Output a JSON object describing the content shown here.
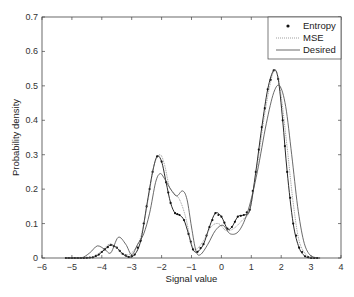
{
  "chart_data": {
    "type": "line",
    "title": "",
    "xlabel": "Signal value",
    "ylabel": "Probability density",
    "xlim": [
      -6,
      4
    ],
    "ylim": [
      0,
      0.7
    ],
    "xticks": [
      -6,
      -5,
      -4,
      -3,
      -2,
      -1,
      0,
      1,
      2,
      3,
      4
    ],
    "yticks": [
      0,
      0.1,
      0.2,
      0.3,
      0.4,
      0.5,
      0.6,
      0.7
    ],
    "grid": false,
    "legend_position": "upper right",
    "series": [
      {
        "name": "Entropy",
        "style": "dotted line with markers",
        "points": [
          [
            -5.2,
            0
          ],
          [
            -4.6,
            0
          ],
          [
            -4.3,
            0.002
          ],
          [
            -4.1,
            0.01
          ],
          [
            -3.9,
            0.025
          ],
          [
            -3.7,
            0.038
          ],
          [
            -3.5,
            0.03
          ],
          [
            -3.3,
            0.012
          ],
          [
            -3.1,
            0.003
          ],
          [
            -2.9,
            0.01
          ],
          [
            -2.7,
            0.05
          ],
          [
            -2.5,
            0.15
          ],
          [
            -2.3,
            0.25
          ],
          [
            -2.15,
            0.295
          ],
          [
            -2.0,
            0.28
          ],
          [
            -1.85,
            0.22
          ],
          [
            -1.7,
            0.16
          ],
          [
            -1.55,
            0.13
          ],
          [
            -1.4,
            0.125
          ],
          [
            -1.25,
            0.11
          ],
          [
            -1.1,
            0.07
          ],
          [
            -0.95,
            0.025
          ],
          [
            -0.8,
            0.018
          ],
          [
            -0.6,
            0.04
          ],
          [
            -0.4,
            0.09
          ],
          [
            -0.2,
            0.13
          ],
          [
            0.0,
            0.12
          ],
          [
            0.2,
            0.085
          ],
          [
            0.35,
            0.09
          ],
          [
            0.55,
            0.12
          ],
          [
            0.75,
            0.125
          ],
          [
            0.95,
            0.14
          ],
          [
            1.15,
            0.25
          ],
          [
            1.35,
            0.38
          ],
          [
            1.55,
            0.49
          ],
          [
            1.75,
            0.545
          ],
          [
            1.9,
            0.52
          ],
          [
            2.05,
            0.4
          ],
          [
            2.2,
            0.25
          ],
          [
            2.4,
            0.1
          ],
          [
            2.6,
            0.03
          ],
          [
            2.8,
            0.005
          ],
          [
            3.0,
            0
          ],
          [
            3.3,
            0
          ]
        ]
      },
      {
        "name": "MSE",
        "style": "thin dotted line",
        "points": [
          [
            -5.2,
            0
          ],
          [
            -4.6,
            0
          ],
          [
            -4.3,
            0.003
          ],
          [
            -4.0,
            0.02
          ],
          [
            -3.75,
            0.04
          ],
          [
            -3.5,
            0.03
          ],
          [
            -3.3,
            0.01
          ],
          [
            -3.0,
            0.015
          ],
          [
            -2.7,
            0.06
          ],
          [
            -2.45,
            0.17
          ],
          [
            -2.25,
            0.27
          ],
          [
            -2.05,
            0.3
          ],
          [
            -1.9,
            0.27
          ],
          [
            -1.75,
            0.21
          ],
          [
            -1.6,
            0.19
          ],
          [
            -1.4,
            0.17
          ],
          [
            -1.2,
            0.12
          ],
          [
            -1.0,
            0.04
          ],
          [
            -0.85,
            0.025
          ],
          [
            -0.6,
            0.05
          ],
          [
            -0.35,
            0.09
          ],
          [
            -0.1,
            0.1
          ],
          [
            0.15,
            0.08
          ],
          [
            0.4,
            0.085
          ],
          [
            0.7,
            0.11
          ],
          [
            0.95,
            0.14
          ],
          [
            1.2,
            0.27
          ],
          [
            1.45,
            0.42
          ],
          [
            1.7,
            0.53
          ],
          [
            1.85,
            0.54
          ],
          [
            2.0,
            0.47
          ],
          [
            2.2,
            0.32
          ],
          [
            2.4,
            0.16
          ],
          [
            2.6,
            0.05
          ],
          [
            2.85,
            0.008
          ],
          [
            3.1,
            0
          ]
        ]
      },
      {
        "name": "Desired",
        "style": "solid line",
        "points": [
          [
            -5.2,
            0
          ],
          [
            -4.7,
            0
          ],
          [
            -4.4,
            0.015
          ],
          [
            -4.15,
            0.035
          ],
          [
            -3.9,
            0.025
          ],
          [
            -3.7,
            0.015
          ],
          [
            -3.45,
            0.06
          ],
          [
            -3.2,
            0.04
          ],
          [
            -3.0,
            0.01
          ],
          [
            -2.8,
            0.04
          ],
          [
            -2.6,
            0.07
          ],
          [
            -2.4,
            0.13
          ],
          [
            -2.2,
            0.22
          ],
          [
            -2.05,
            0.245
          ],
          [
            -1.9,
            0.23
          ],
          [
            -1.7,
            0.2
          ],
          [
            -1.5,
            0.18
          ],
          [
            -1.3,
            0.195
          ],
          [
            -1.15,
            0.17
          ],
          [
            -1.0,
            0.09
          ],
          [
            -0.85,
            0.02
          ],
          [
            -0.7,
            0.01
          ],
          [
            -0.45,
            0.04
          ],
          [
            -0.2,
            0.08
          ],
          [
            0.05,
            0.095
          ],
          [
            0.3,
            0.07
          ],
          [
            0.6,
            0.08
          ],
          [
            0.9,
            0.14
          ],
          [
            1.2,
            0.25
          ],
          [
            1.5,
            0.39
          ],
          [
            1.75,
            0.48
          ],
          [
            1.95,
            0.5
          ],
          [
            2.15,
            0.44
          ],
          [
            2.35,
            0.3
          ],
          [
            2.55,
            0.15
          ],
          [
            2.75,
            0.05
          ],
          [
            2.95,
            0.01
          ],
          [
            3.2,
            0
          ]
        ]
      }
    ]
  },
  "legend": {
    "items": [
      "Entropy",
      "MSE",
      "Desired"
    ]
  }
}
